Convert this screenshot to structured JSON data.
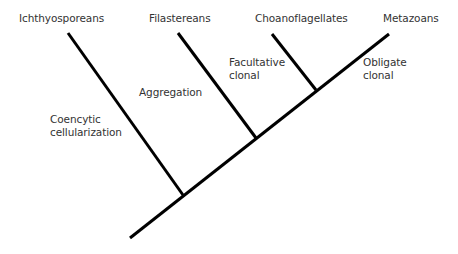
{
  "diagram": {
    "type": "cladogram",
    "colors": {
      "line": "#000000",
      "text": "#333333",
      "background": "#ffffff"
    },
    "taxa": [
      {
        "id": "ichthyosporeans",
        "label": "Ichthyosporeans"
      },
      {
        "id": "filastereans",
        "label": "Filastereans"
      },
      {
        "id": "choanoflagellates",
        "label": "Choanoflagellates"
      },
      {
        "id": "metazoans",
        "label": "Metazoans"
      }
    ],
    "traits": [
      {
        "id": "coencytic",
        "lines": [
          "Coencytic",
          "cellularization"
        ]
      },
      {
        "id": "aggregation",
        "lines": [
          "Aggregation"
        ]
      },
      {
        "id": "facultative",
        "lines": [
          "Facultative",
          "clonal"
        ]
      },
      {
        "id": "obligate",
        "lines": [
          "Obligate",
          "clonal"
        ]
      }
    ],
    "topology": "(Ichthyosporeans,(Filastereans,(Choanoflagellates,Metazoans)))"
  }
}
